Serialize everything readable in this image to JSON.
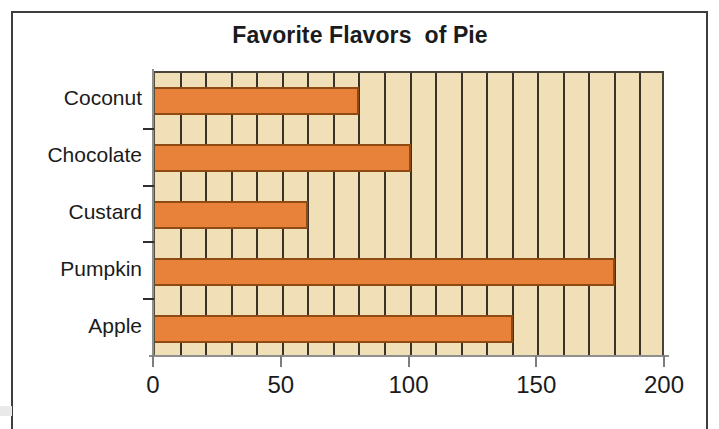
{
  "chart_data": {
    "type": "bar",
    "orientation": "horizontal",
    "title": "Favorite Flavors  of Pie",
    "xlabel": "",
    "ylabel": "",
    "categories": [
      "Apple",
      "Pumpkin",
      "Custard",
      "Chocolate",
      "Coconut"
    ],
    "values": [
      140,
      180,
      60,
      100,
      80
    ],
    "series": [
      {
        "name": "Votes",
        "values": [
          140,
          180,
          60,
          100,
          80
        ]
      }
    ],
    "category_order_top_to_bottom": [
      "Coconut",
      "Chocolate",
      "Custard",
      "Pumpkin",
      "Apple"
    ],
    "values_top_to_bottom": [
      80,
      100,
      60,
      180,
      140
    ],
    "xlim": [
      0,
      200
    ],
    "x_major_ticks": [
      0,
      50,
      100,
      150,
      200
    ],
    "x_tick_labels": [
      "0",
      "50",
      "100",
      "150",
      "200"
    ],
    "x_minor_interval": 10,
    "grid": "vertical-minor",
    "legend": "none",
    "colors": {
      "bar_fill": "#e8823a",
      "bar_outline": "#8e4a13",
      "plot_background": "#f0dfb7",
      "gridline": "#3a3428",
      "axis_line": "#8f8f8f",
      "text": "#1b1b1b",
      "frame": "#3d3d3d",
      "page_background": "#ffffff"
    }
  },
  "figure": {
    "title": "Favorite Flavors  of Pie",
    "axis_y_labels": [
      "Coconut",
      "Chocolate",
      "Custard",
      "Pumpkin",
      "Apple"
    ],
    "axis_x_labels": [
      "0",
      "50",
      "100",
      "150",
      "200"
    ]
  }
}
